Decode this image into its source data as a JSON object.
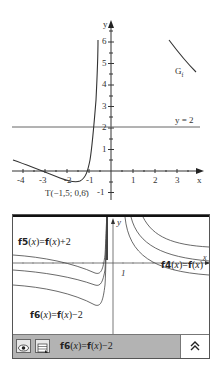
{
  "top_graph": {
    "x_axis_label": "x",
    "y_axis_label": "y",
    "x_ticks": [
      "-4",
      "-3",
      "-2",
      "-1",
      "1",
      "2",
      "3"
    ],
    "y_ticks": [
      "-1",
      "1",
      "2",
      "3",
      "4",
      "5",
      "6"
    ],
    "asymptote_label": "y = 2",
    "graph_label": "G",
    "graph_label_sub": "f",
    "point_label": "T(−1,5; 0,6̄)"
  },
  "calculator": {
    "curve_labels": {
      "f5": {
        "name": "f5",
        "arg": "x",
        "rhs_name": "f",
        "rhs_arg": "x",
        "suffix": "+2"
      },
      "f4": {
        "name": "f4",
        "arg": "x",
        "rhs_name": "f",
        "rhs_arg": "x",
        "suffix": ""
      },
      "f6": {
        "name": "f6",
        "arg": "x",
        "rhs_name": "f",
        "rhs_arg": "x",
        "suffix": "−2"
      }
    },
    "axis_x_label": "x",
    "axis_y_label": "y",
    "unit_label": "1",
    "entry_line": {
      "name": "f6",
      "arg": "x",
      "rhs_name": "f",
      "rhs_arg": "x",
      "suffix": "−2"
    },
    "icons": {
      "show": "eye-icon",
      "table": "table-icon",
      "expand": "double-chevron-up-icon"
    },
    "expand_glyph": "≈"
  },
  "colors": {
    "axis": "#333333",
    "curve": "#444444",
    "bar": "#b3b3b3",
    "frame": "#111111"
  }
}
